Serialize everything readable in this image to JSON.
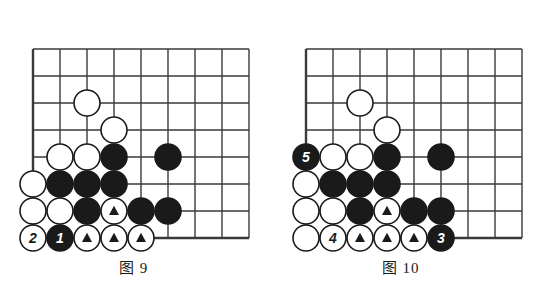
{
  "page": {
    "background": "#ffffff",
    "ink": "#1a1a1a"
  },
  "colors": {
    "line": "#3a3a3a",
    "black_stone": "#1a1a1a",
    "white_stone": "#ffffff",
    "stone_outline": "#1a1a1a",
    "black_label_text": "#ffffff",
    "white_label_text": "#1a1a1a"
  },
  "geometry": {
    "cell": 27,
    "stone_radius": 13,
    "cols": 8,
    "rows": 7
  },
  "figures": [
    {
      "id": "figure-9",
      "caption": "图 9",
      "caption_left": 0,
      "caption_top": 256,
      "origin_x": 33,
      "origin_y": 238,
      "grid": {
        "left_edge_col": 0,
        "bottom_edge_row": 0,
        "top_row": 7,
        "right_col": 8
      },
      "stones": [
        {
          "name": "white-stone",
          "color": "white",
          "col": 0,
          "row": 0,
          "label": "2",
          "marked": false
        },
        {
          "name": "black-stone",
          "color": "black",
          "col": 1,
          "row": 0,
          "label": "1",
          "marked": false
        },
        {
          "name": "white-stone-marked",
          "color": "white",
          "col": 2,
          "row": 0,
          "label": "",
          "marked": true
        },
        {
          "name": "white-stone-marked",
          "color": "white",
          "col": 3,
          "row": 0,
          "label": "",
          "marked": true
        },
        {
          "name": "white-stone-marked",
          "color": "white",
          "col": 4,
          "row": 0,
          "label": "",
          "marked": true
        },
        {
          "name": "white-stone",
          "color": "white",
          "col": 0,
          "row": 1,
          "label": "",
          "marked": false
        },
        {
          "name": "white-stone",
          "color": "white",
          "col": 1,
          "row": 1,
          "label": "",
          "marked": false
        },
        {
          "name": "black-stone",
          "color": "black",
          "col": 2,
          "row": 1,
          "label": "",
          "marked": false
        },
        {
          "name": "white-stone-marked",
          "color": "white",
          "col": 3,
          "row": 1,
          "label": "",
          "marked": true
        },
        {
          "name": "black-stone",
          "color": "black",
          "col": 4,
          "row": 1,
          "label": "",
          "marked": false
        },
        {
          "name": "black-stone",
          "color": "black",
          "col": 5,
          "row": 1,
          "label": "",
          "marked": false
        },
        {
          "name": "white-stone",
          "color": "white",
          "col": 0,
          "row": 2,
          "label": "",
          "marked": false
        },
        {
          "name": "black-stone",
          "color": "black",
          "col": 1,
          "row": 2,
          "label": "",
          "marked": false
        },
        {
          "name": "black-stone",
          "color": "black",
          "col": 2,
          "row": 2,
          "label": "",
          "marked": false
        },
        {
          "name": "black-stone",
          "color": "black",
          "col": 3,
          "row": 2,
          "label": "",
          "marked": false
        },
        {
          "name": "white-stone",
          "color": "white",
          "col": 1,
          "row": 3,
          "label": "",
          "marked": false
        },
        {
          "name": "white-stone",
          "color": "white",
          "col": 2,
          "row": 3,
          "label": "",
          "marked": false
        },
        {
          "name": "black-stone",
          "color": "black",
          "col": 3,
          "row": 3,
          "label": "",
          "marked": false
        },
        {
          "name": "black-stone",
          "color": "black",
          "col": 5,
          "row": 3,
          "label": "",
          "marked": false
        },
        {
          "name": "white-stone",
          "color": "white",
          "col": 3,
          "row": 4,
          "label": "",
          "marked": false
        },
        {
          "name": "white-stone",
          "color": "white",
          "col": 2,
          "row": 5,
          "label": "",
          "marked": false
        }
      ]
    },
    {
      "id": "figure-10",
      "caption": "图 10",
      "caption_left": 0,
      "caption_top": 256,
      "origin_x": 39,
      "origin_y": 238,
      "grid": {
        "left_edge_col": 0,
        "bottom_edge_row": 0,
        "top_row": 7,
        "right_col": 8
      },
      "stones": [
        {
          "name": "white-stone",
          "color": "white",
          "col": 0,
          "row": 0,
          "label": "",
          "marked": false
        },
        {
          "name": "white-stone",
          "color": "white",
          "col": 1,
          "row": 0,
          "label": "4",
          "marked": false
        },
        {
          "name": "white-stone-marked",
          "color": "white",
          "col": 2,
          "row": 0,
          "label": "",
          "marked": true
        },
        {
          "name": "white-stone-marked",
          "color": "white",
          "col": 3,
          "row": 0,
          "label": "",
          "marked": true
        },
        {
          "name": "white-stone-marked",
          "color": "white",
          "col": 4,
          "row": 0,
          "label": "",
          "marked": true
        },
        {
          "name": "black-stone",
          "color": "black",
          "col": 5,
          "row": 0,
          "label": "3",
          "marked": false
        },
        {
          "name": "white-stone",
          "color": "white",
          "col": 0,
          "row": 1,
          "label": "",
          "marked": false
        },
        {
          "name": "white-stone",
          "color": "white",
          "col": 1,
          "row": 1,
          "label": "",
          "marked": false
        },
        {
          "name": "black-stone",
          "color": "black",
          "col": 2,
          "row": 1,
          "label": "",
          "marked": false
        },
        {
          "name": "white-stone-marked",
          "color": "white",
          "col": 3,
          "row": 1,
          "label": "",
          "marked": true
        },
        {
          "name": "black-stone",
          "color": "black",
          "col": 4,
          "row": 1,
          "label": "",
          "marked": false
        },
        {
          "name": "black-stone",
          "color": "black",
          "col": 5,
          "row": 1,
          "label": "",
          "marked": false
        },
        {
          "name": "white-stone",
          "color": "white",
          "col": 0,
          "row": 2,
          "label": "",
          "marked": false
        },
        {
          "name": "black-stone",
          "color": "black",
          "col": 1,
          "row": 2,
          "label": "",
          "marked": false
        },
        {
          "name": "black-stone",
          "color": "black",
          "col": 2,
          "row": 2,
          "label": "",
          "marked": false
        },
        {
          "name": "black-stone",
          "color": "black",
          "col": 3,
          "row": 2,
          "label": "",
          "marked": false
        },
        {
          "name": "black-stone",
          "color": "black",
          "col": 0,
          "row": 3,
          "label": "5",
          "marked": false
        },
        {
          "name": "white-stone",
          "color": "white",
          "col": 1,
          "row": 3,
          "label": "",
          "marked": false
        },
        {
          "name": "white-stone",
          "color": "white",
          "col": 2,
          "row": 3,
          "label": "",
          "marked": false
        },
        {
          "name": "black-stone",
          "color": "black",
          "col": 3,
          "row": 3,
          "label": "",
          "marked": false
        },
        {
          "name": "black-stone",
          "color": "black",
          "col": 5,
          "row": 3,
          "label": "",
          "marked": false
        },
        {
          "name": "white-stone",
          "color": "white",
          "col": 3,
          "row": 4,
          "label": "",
          "marked": false
        },
        {
          "name": "white-stone",
          "color": "white",
          "col": 2,
          "row": 5,
          "label": "",
          "marked": false
        }
      ]
    }
  ]
}
